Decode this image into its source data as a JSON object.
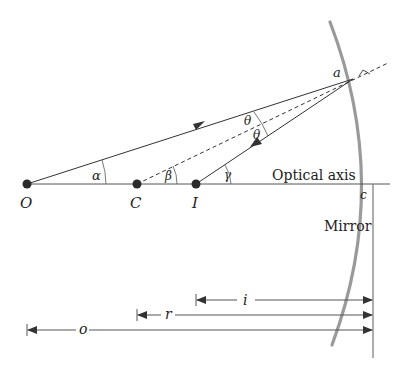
{
  "diagram": {
    "type": "concave-mirror-ray-diagram",
    "colors": {
      "line": "#333333",
      "mirror": "#9a9a9a",
      "axis": "#555555",
      "point": "#2a2a2a"
    },
    "points": {
      "object": {
        "label": "O"
      },
      "center": {
        "label": "C"
      },
      "image": {
        "label": "I"
      },
      "reflection_point": {
        "label": "a"
      },
      "vertex": {
        "label": "c"
      }
    },
    "angles": {
      "alpha": "α",
      "beta": "β",
      "gamma": "γ",
      "theta_incident": "θ",
      "theta_reflected": "θ"
    },
    "labels": {
      "optical_axis": "Optical axis",
      "mirror": "Mirror"
    },
    "distances": {
      "image_distance": "i",
      "radius": "r",
      "object_distance": "o"
    }
  }
}
